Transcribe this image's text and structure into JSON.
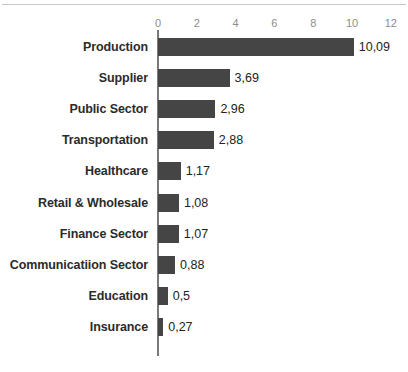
{
  "chart_data": {
    "type": "bar",
    "orientation": "horizontal",
    "title": "",
    "subtitle": "",
    "xlabel": "",
    "ylabel": "",
    "xlim": [
      0,
      12
    ],
    "grid": false,
    "legend": false,
    "decimal_separator": ",",
    "bar_color": "#454545",
    "axis_color": "#7a7a7a",
    "tick_label_color": "#8d8d8d",
    "category_label_color": "#2b2b2b",
    "value_label_color": "#232323",
    "background_color": "#ffffff",
    "xticks": [
      0,
      2,
      4,
      6,
      8,
      10,
      12
    ],
    "xtick_labels": [
      "0",
      "2",
      "4",
      "6",
      "8",
      "10",
      "12"
    ],
    "categories": [
      "Production",
      "Supplier",
      "Public Sector",
      "Transportation",
      "Healthcare",
      "Retail & Wholesale",
      "Finance Sector",
      "Communicatiion Sector",
      "Education",
      "Insurance"
    ],
    "values": [
      10.09,
      3.69,
      2.96,
      2.88,
      1.17,
      1.08,
      1.07,
      0.88,
      0.5,
      0.27
    ],
    "value_labels": [
      "10,09",
      "3,69",
      "2,96",
      "2,88",
      "1,17",
      "1,08",
      "1,07",
      "0,88",
      "0,5",
      "0,27"
    ]
  }
}
